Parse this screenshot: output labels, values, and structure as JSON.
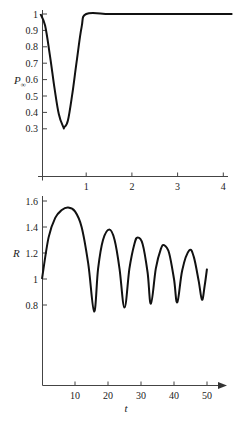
{
  "chart_data": [
    {
      "type": "line",
      "title": "",
      "xlabel": "",
      "ylabel": "P∞",
      "ylabel_main": "P",
      "ylabel_sub": "∞",
      "xlim": [
        0,
        4.2
      ],
      "ylim": [
        0,
        1
      ],
      "x_ticks": [
        1,
        2,
        3,
        4
      ],
      "x_tick_labels": [
        "1",
        "2",
        "3",
        "4"
      ],
      "y_ticks": [
        1,
        0.9,
        0.8,
        0.7,
        0.6,
        0.5,
        0.4,
        0.3
      ],
      "y_tick_labels": [
        "1",
        "0.9",
        "0.8",
        "0.7",
        "0.6",
        "0.5",
        "0.4",
        "0.3"
      ],
      "grid": false,
      "series": [
        {
          "name": "P∞",
          "x": [
            0,
            0.1,
            0.2,
            0.3,
            0.4,
            0.5,
            0.52,
            0.6,
            0.7,
            0.8,
            0.9,
            1.0,
            1.5,
            2,
            2.5,
            3,
            3.5,
            4,
            4.2
          ],
          "y": [
            1,
            0.93,
            0.76,
            0.56,
            0.39,
            0.31,
            0.31,
            0.35,
            0.52,
            0.73,
            0.92,
            1,
            1,
            1,
            1,
            1,
            1,
            1,
            1
          ]
        }
      ]
    },
    {
      "type": "line",
      "title": "",
      "xlabel": "t",
      "ylabel": "R",
      "xlim": [
        0,
        55
      ],
      "ylim": [
        0,
        1.7
      ],
      "x_ticks": [
        10,
        20,
        30,
        40,
        50
      ],
      "x_tick_labels": [
        "10",
        "20",
        "30",
        "40",
        "50"
      ],
      "y_ticks": [
        1.6,
        1.4,
        1.2,
        1,
        0.8
      ],
      "y_tick_labels": [
        "1.6",
        "1.4",
        "1.2",
        "1",
        "0.8"
      ],
      "grid": false,
      "series": [
        {
          "name": "R",
          "x": [
            0,
            2,
            4,
            6,
            7.9,
            10,
            12,
            14,
            15.8,
            17,
            18.5,
            20.4,
            22,
            23.5,
            25,
            26.5,
            28,
            29,
            30.5,
            32,
            33,
            34.5,
            36,
            37,
            38.5,
            40,
            41,
            42.5,
            44.6,
            46,
            47.5,
            48.5,
            49.3,
            50
          ],
          "y": [
            1.0,
            1.32,
            1.47,
            1.53,
            1.55,
            1.52,
            1.4,
            1.12,
            0.75,
            1.08,
            1.3,
            1.38,
            1.3,
            1.08,
            0.78,
            1.08,
            1.27,
            1.32,
            1.27,
            1.05,
            0.81,
            1.08,
            1.23,
            1.26,
            1.2,
            1.0,
            0.82,
            1.07,
            1.22,
            1.17,
            0.98,
            0.84,
            0.95,
            1.08
          ]
        }
      ]
    }
  ]
}
